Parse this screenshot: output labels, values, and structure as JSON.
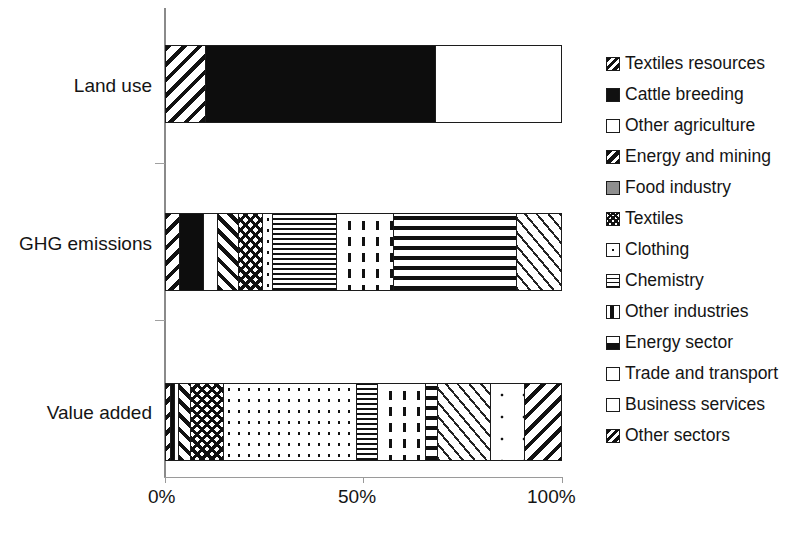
{
  "chart_data": {
    "type": "bar",
    "orientation": "horizontal",
    "stacked": true,
    "normalized": true,
    "title": "",
    "xlabel": "",
    "ylabel": "",
    "xlim": [
      0,
      100
    ],
    "grid": false,
    "legend_position": "right",
    "xticks": [
      "0%",
      "50%",
      "100%"
    ],
    "xtick_values": [
      0,
      50,
      100
    ],
    "categories": [
      "Land use",
      "GHG emissions",
      "Value added"
    ],
    "series": [
      {
        "name": "Textiles resources",
        "pattern": "diagonal-hatch-back",
        "values": [
          10.0,
          4.5,
          1.0
        ]
      },
      {
        "name": "Cattle breeding",
        "pattern": "solid-black",
        "values": [
          58.0,
          6.5,
          0.5
        ]
      },
      {
        "name": "Other agriculture",
        "pattern": "white",
        "values": [
          32.0,
          4.0,
          1.0
        ]
      },
      {
        "name": "Energy and mining",
        "pattern": "diagonal-hatch-fwd",
        "values": [
          0,
          6.0,
          3.0
        ]
      },
      {
        "name": "Food industry",
        "pattern": "grey-solid",
        "values": [
          0,
          0,
          0
        ]
      },
      {
        "name": "Textiles",
        "pattern": "cross-hatch",
        "values": [
          0,
          5.5,
          8.5
        ]
      },
      {
        "name": "Clothing",
        "pattern": "fine-dots",
        "values": [
          0,
          2.5,
          22.0
        ]
      },
      {
        "name": "Chemistry",
        "pattern": "horizontal-lines",
        "values": [
          0,
          14.5,
          4.0
        ]
      },
      {
        "name": "Other industries",
        "pattern": "vertical-dashes",
        "values": [
          0,
          13.0,
          9.0
        ]
      },
      {
        "name": "Energy sector",
        "pattern": "thick-horizontal",
        "values": [
          0,
          0,
          2.5
        ]
      },
      {
        "name": "Trade and transport",
        "pattern": "thin-diagonals",
        "values": [
          0,
          0,
          14.0
        ]
      },
      {
        "name": "Business services",
        "pattern": "sparse-dots",
        "values": [
          0,
          0,
          11.5
        ]
      },
      {
        "name": "Other sectors",
        "pattern": "diagonal-hatch-back",
        "values": [
          0,
          8.5,
          13.0
        ]
      }
    ],
    "bars": [
      {
        "category": "Land use",
        "segments": [
          {
            "name": "Textiles resources",
            "pattern": "diagonal-hatch-back",
            "start": 0.0,
            "end": 10.0
          },
          {
            "name": "Cattle breeding",
            "pattern": "solid-black",
            "start": 10.0,
            "end": 68.0
          },
          {
            "name": "Other agriculture",
            "pattern": "white",
            "start": 68.0,
            "end": 100.0
          }
        ]
      },
      {
        "category": "GHG emissions",
        "segments": [
          {
            "name": "Textiles resources",
            "pattern": "diagonal-hatch-back",
            "start": 0.0,
            "end": 3.5
          },
          {
            "name": "Cattle breeding",
            "pattern": "solid-black",
            "start": 3.5,
            "end": 9.5
          },
          {
            "name": "Other agriculture",
            "pattern": "white",
            "start": 9.5,
            "end": 13.0
          },
          {
            "name": "Energy and mining",
            "pattern": "diagonal-hatch-fwd",
            "start": 13.0,
            "end": 18.5
          },
          {
            "name": "Textiles",
            "pattern": "cross-hatch",
            "start": 18.5,
            "end": 24.5
          },
          {
            "name": "Clothing",
            "pattern": "fine-dots",
            "start": 24.5,
            "end": 27.0
          },
          {
            "name": "Chemistry",
            "pattern": "horizontal-lines",
            "start": 27.0,
            "end": 43.0
          },
          {
            "name": "Other industries",
            "pattern": "vertical-dashes",
            "start": 43.0,
            "end": 57.5
          },
          {
            "name": "Energy sector",
            "pattern": "thick-horizontal",
            "start": 57.5,
            "end": 88.5
          },
          {
            "name": "Other sectors",
            "pattern": "thin-diagonals",
            "start": 88.5,
            "end": 100.0
          }
        ]
      },
      {
        "category": "Value added",
        "segments": [
          {
            "name": "Textiles resources",
            "pattern": "diagonal-hatch-back",
            "start": 0.0,
            "end": 1.2
          },
          {
            "name": "Cattle breeding",
            "pattern": "solid-black",
            "start": 1.2,
            "end": 2.2
          },
          {
            "name": "Other agriculture",
            "pattern": "white",
            "start": 2.2,
            "end": 3.4
          },
          {
            "name": "Energy and mining",
            "pattern": "diagonal-hatch-fwd",
            "start": 3.4,
            "end": 6.2
          },
          {
            "name": "Textiles",
            "pattern": "cross-hatch",
            "start": 6.2,
            "end": 14.5
          },
          {
            "name": "Clothing",
            "pattern": "fine-dots",
            "start": 14.5,
            "end": 48.0
          },
          {
            "name": "Chemistry",
            "pattern": "horizontal-lines",
            "start": 48.0,
            "end": 53.5
          },
          {
            "name": "Other industries",
            "pattern": "vertical-dashes",
            "start": 53.5,
            "end": 65.5
          },
          {
            "name": "Energy sector",
            "pattern": "thick-horizontal",
            "start": 65.5,
            "end": 68.5
          },
          {
            "name": "Trade and transport",
            "pattern": "thin-diagonals",
            "start": 68.5,
            "end": 82.0
          },
          {
            "name": "Business services",
            "pattern": "sparse-dots",
            "start": 82.0,
            "end": 90.5
          },
          {
            "name": "Other sectors",
            "pattern": "diagonal-hatch-back",
            "start": 90.5,
            "end": 100.0
          }
        ]
      }
    ]
  },
  "axis": {
    "y_categories": [
      {
        "label": "Land use"
      },
      {
        "label": "GHG emissions"
      },
      {
        "label": "Value added"
      }
    ],
    "x_ticks": [
      {
        "label": "0%",
        "value": 0
      },
      {
        "label": "50%",
        "value": 50
      },
      {
        "label": "100%",
        "value": 100
      }
    ]
  },
  "legend": {
    "items": [
      {
        "label": "Textiles resources",
        "icon": "swatch-diagonal-hatch-back-icon"
      },
      {
        "label": "Cattle breeding",
        "icon": "swatch-solid-black-icon"
      },
      {
        "label": "Other agriculture",
        "icon": "swatch-white-icon"
      },
      {
        "label": "Energy and mining",
        "icon": "swatch-diagonal-hatch-dense-icon"
      },
      {
        "label": "Food industry",
        "icon": "swatch-grey-solid-icon"
      },
      {
        "label": "Textiles",
        "icon": "swatch-cross-hatch-icon"
      },
      {
        "label": "Clothing",
        "icon": "swatch-center-dot-icon"
      },
      {
        "label": "Chemistry",
        "icon": "swatch-horizontal-lines-icon"
      },
      {
        "label": "Other industries",
        "icon": "swatch-vertical-dash-icon"
      },
      {
        "label": "Energy sector",
        "icon": "swatch-thick-horizontal-icon"
      },
      {
        "label": "Trade and transport",
        "icon": "swatch-white-icon"
      },
      {
        "label": "Business services",
        "icon": "swatch-white-icon"
      },
      {
        "label": "Other sectors",
        "icon": "swatch-diagonal-hatch-back-icon"
      }
    ]
  }
}
